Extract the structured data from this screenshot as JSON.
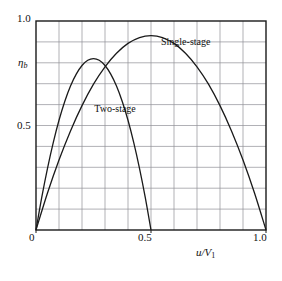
{
  "chart_data": {
    "type": "line",
    "title": "",
    "xlabel": "u/V1",
    "ylabel": "eta_b",
    "xlim": [
      0,
      1.0
    ],
    "ylim": [
      0,
      1.0
    ],
    "grid": true,
    "grid_step_x": 0.1,
    "grid_step_y": 0.1,
    "xticks": [
      0,
      0.5,
      1.0
    ],
    "xtick_labels": [
      "0",
      "0.5",
      "1.0"
    ],
    "yticks": [
      0,
      0.5,
      1.0
    ],
    "ytick_labels": [
      "0",
      "0.5",
      "1.0"
    ],
    "legend_position": "inline-annotations",
    "series": [
      {
        "name": "Single-stage",
        "peak_x": 0.5,
        "peak_y": 0.93,
        "zero_crossings": [
          0.0,
          1.0
        ],
        "x": [
          0.0,
          0.05,
          0.1,
          0.15,
          0.2,
          0.25,
          0.3,
          0.35,
          0.4,
          0.45,
          0.5,
          0.55,
          0.6,
          0.65,
          0.7,
          0.75,
          0.8,
          0.85,
          0.9,
          0.95,
          1.0
        ],
        "y": [
          0.0,
          0.177,
          0.335,
          0.474,
          0.595,
          0.698,
          0.781,
          0.846,
          0.893,
          0.921,
          0.93,
          0.921,
          0.893,
          0.846,
          0.781,
          0.698,
          0.595,
          0.474,
          0.335,
          0.177,
          0.0
        ]
      },
      {
        "name": "Two-stage",
        "peak_x": 0.25,
        "peak_y": 0.82,
        "zero_crossings": [
          0.0,
          0.5
        ],
        "x": [
          0.0,
          0.025,
          0.05,
          0.075,
          0.1,
          0.125,
          0.15,
          0.175,
          0.2,
          0.225,
          0.25,
          0.275,
          0.3,
          0.325,
          0.35,
          0.375,
          0.4,
          0.425,
          0.45,
          0.475,
          0.5
        ],
        "y": [
          0.0,
          0.156,
          0.295,
          0.418,
          0.525,
          0.615,
          0.689,
          0.746,
          0.787,
          0.812,
          0.82,
          0.812,
          0.787,
          0.746,
          0.689,
          0.615,
          0.525,
          0.418,
          0.295,
          0.156,
          0.0
        ]
      }
    ],
    "annotations": [
      {
        "text": "Single-stage",
        "x": 0.7,
        "y": 0.9
      },
      {
        "text": "Two-stage",
        "x": 0.41,
        "y": 0.58
      }
    ],
    "colors": {
      "curve": "#1a1a1a",
      "grid": "#8f8f97",
      "frame": "#1a1a1a",
      "background": "#ffffff"
    }
  },
  "labels": {
    "y_top": "1.0",
    "y_mid": "0.5",
    "y_axis_symbol": "η",
    "y_axis_sub": "b",
    "x_zero": "0",
    "x_half": "0.5",
    "x_one": "1.0",
    "x_axis_num": "u/V",
    "x_axis_sub": "1",
    "series_single": "Single-stage",
    "series_two": "Two-stage"
  },
  "caption": {
    "text": ""
  }
}
